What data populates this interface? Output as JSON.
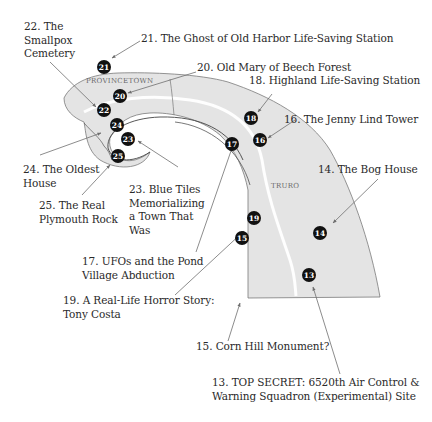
{
  "map": {
    "towns": [
      {
        "name": "PROVINCETOWN"
      },
      {
        "name": "TRURO"
      }
    ],
    "colors": {
      "land": "#e4e4e4",
      "outline": "#7a7a7a",
      "marker": "#111111",
      "marker_text": "#ffffff",
      "leader": "#6e6e6e",
      "road": "#ffffff"
    },
    "markers": [
      {
        "num": "13",
        "label_lines": [
          "13. TOP SECRET: 6520th Air Control &",
          "Warning Squadron (Experimental) Site"
        ]
      },
      {
        "num": "14",
        "label_lines": [
          "14. The Bog House"
        ]
      },
      {
        "num": "15",
        "label_lines": [
          "15. Corn Hill Monument?"
        ]
      },
      {
        "num": "16",
        "label_lines": [
          "16. The Jenny Lind Tower"
        ]
      },
      {
        "num": "17",
        "label_lines": [
          "17. UFOs and the Pond",
          "Village Abduction"
        ]
      },
      {
        "num": "18",
        "label_lines": [
          "18. Highland Life-Saving Station"
        ]
      },
      {
        "num": "19",
        "label_lines": [
          "19. A Real-Life Horror Story:",
          "Tony Costa"
        ]
      },
      {
        "num": "20",
        "label_lines": [
          "20. Old Mary of Beech Forest"
        ]
      },
      {
        "num": "21",
        "label_lines": [
          "21. The Ghost of Old Harbor Life-Saving Station"
        ]
      },
      {
        "num": "22",
        "label_lines": [
          "22. The",
          "Smallpox",
          "Cemetery"
        ]
      },
      {
        "num": "23",
        "label_lines": [
          "23. Blue Tiles",
          "Memorializing",
          "a Town That",
          "Was"
        ]
      },
      {
        "num": "24",
        "label_lines": [
          "24. The Oldest",
          "House"
        ]
      },
      {
        "num": "25",
        "label_lines": [
          "25. The Real",
          "Plymouth Rock"
        ]
      }
    ]
  }
}
